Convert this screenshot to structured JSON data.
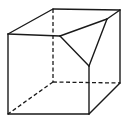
{
  "diagram": {
    "colors": {
      "background": "#ffffff",
      "stroke": "#1a1a1a"
    },
    "vertices": {
      "front_top_left": [
        8,
        34
      ],
      "front_bottom_left": [
        8,
        114
      ],
      "front_bottom_right": [
        89,
        114
      ],
      "back_top_left": [
        53,
        9
      ],
      "back_top_right": [
        120,
        10
      ],
      "back_bottom_right": [
        120,
        83
      ],
      "back_bottom_left": [
        53,
        82
      ],
      "cut_point_front_top_edge": [
        60,
        36
      ],
      "cut_point_top_right_edge": [
        107,
        19
      ],
      "cut_point_front_right_edge": [
        89,
        66
      ]
    },
    "visible_edges": [
      {
        "from": "front_top_left",
        "to": "back_top_left"
      },
      {
        "from": "back_top_left",
        "to": "back_top_right"
      },
      {
        "from": "back_top_right",
        "to": "cut_point_top_right_edge"
      },
      {
        "from": "front_top_left",
        "to": "cut_point_front_top_edge"
      },
      {
        "from": "front_top_left",
        "to": "front_bottom_left"
      },
      {
        "from": "front_bottom_left",
        "to": "front_bottom_right"
      },
      {
        "from": "front_bottom_right",
        "to": "cut_point_front_right_edge"
      },
      {
        "from": "front_bottom_right",
        "to": "back_bottom_right"
      },
      {
        "from": "back_top_right",
        "to": "back_bottom_right"
      },
      {
        "from": "cut_point_front_top_edge",
        "to": "cut_point_top_right_edge"
      },
      {
        "from": "cut_point_top_right_edge",
        "to": "cut_point_front_right_edge"
      },
      {
        "from": "cut_point_front_right_edge",
        "to": "cut_point_front_top_edge"
      }
    ],
    "hidden_edges": [
      {
        "from": "back_top_left",
        "to": "back_bottom_left"
      },
      {
        "from": "back_bottom_left",
        "to": "back_bottom_right"
      },
      {
        "from": "back_bottom_left",
        "to": "front_bottom_left"
      }
    ]
  }
}
